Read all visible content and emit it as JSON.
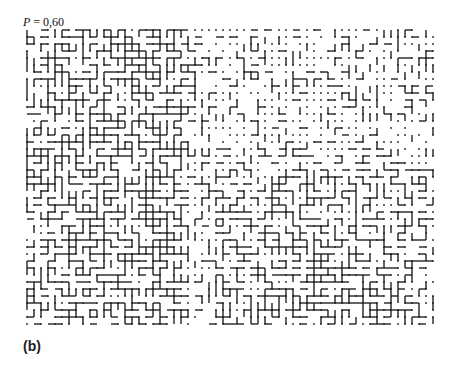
{
  "figure": {
    "probability_label": "P = 0,60",
    "probability_symbol": "P",
    "probability_value": "= 0,60",
    "panel_label": "(b)",
    "lattice": {
      "type": "square-lattice bond percolation",
      "probability": 0.6,
      "columns": 59,
      "rows": 43,
      "origin_x": 27,
      "origin_y": 30,
      "spacing": 7,
      "site_color": "#222222",
      "bond_color": "#111111"
    }
  }
}
